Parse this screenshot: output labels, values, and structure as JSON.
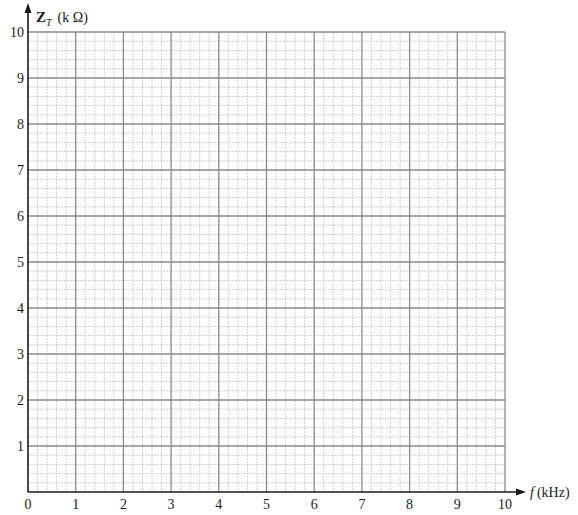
{
  "chart_data": {
    "type": "line",
    "title": "",
    "xlabel": "f (kHz)",
    "ylabel": "Z_T (kΩ)",
    "ylabel_parts": {
      "symbol": "Z",
      "subscript": "T",
      "unit": "(k Ω)"
    },
    "xlabel_parts": {
      "symbol": "f",
      "unit": "(kHz)"
    },
    "xlim": [
      0,
      10
    ],
    "ylim": [
      0,
      10
    ],
    "x_ticks": [
      0,
      1,
      2,
      3,
      4,
      5,
      6,
      7,
      8,
      9,
      10
    ],
    "y_ticks": [
      1,
      2,
      3,
      4,
      5,
      6,
      7,
      8,
      9,
      10
    ],
    "x_tick_labels": [
      "0",
      "1",
      "2",
      "3",
      "4",
      "5",
      "6",
      "7",
      "8",
      "9",
      "10"
    ],
    "y_tick_labels": [
      "1",
      "2",
      "3",
      "4",
      "5",
      "6",
      "7",
      "8",
      "9",
      "10"
    ],
    "grid": true,
    "grid_major_step": 1,
    "grid_minor_step": 0.2,
    "series": [],
    "legend": null
  },
  "style": {
    "major_grid_color": "#8a8a8a",
    "minor_grid_color": "#c4c4c4",
    "axis_color": "#1a1a1a",
    "background": "#ffffff"
  }
}
